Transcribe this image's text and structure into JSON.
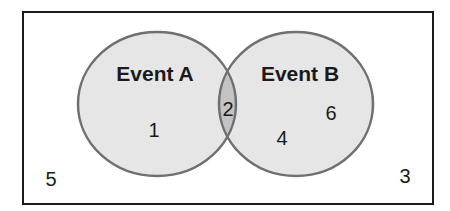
{
  "diagram": {
    "type": "venn",
    "universe": {
      "label": "",
      "outside_elements": [
        "5",
        "3"
      ]
    },
    "sets": [
      {
        "name": "Event A",
        "only_elements": [
          "1"
        ]
      },
      {
        "name": "Event B",
        "only_elements": [
          "6",
          "4"
        ]
      }
    ],
    "intersection": {
      "elements": [
        "2"
      ]
    },
    "labels": {
      "event_a": "Event A",
      "event_b": "Event B",
      "a_only_1": "1",
      "intersection_2": "2",
      "b_only_6": "6",
      "b_only_4": "4",
      "outside_5": "5",
      "outside_3": "3"
    },
    "colors": {
      "set_fill": "#e6e6e6",
      "intersection_fill": "#c3c3c3",
      "circle_stroke": "#6f6f6f",
      "border": "#1a1a1a",
      "background": "#ffffff"
    }
  }
}
